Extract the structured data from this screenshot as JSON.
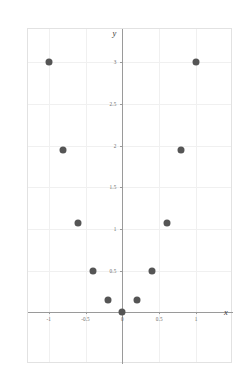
{
  "chart_data": {
    "type": "scatter",
    "title": "",
    "subtitle": "",
    "xlabel": "x",
    "ylabel": "y",
    "xlim": [
      -1.28,
      1.5
    ],
    "ylim": [
      -0.62,
      3.4
    ],
    "grid": true,
    "legend": null,
    "marker_color": "#555555",
    "x": [
      -1,
      -0.8,
      -0.6,
      -0.4,
      -0.2,
      0,
      0.2,
      0.4,
      0.6,
      0.8,
      1
    ],
    "y": [
      3,
      1.95,
      1.07,
      0.5,
      0.15,
      0,
      0.15,
      0.5,
      1.07,
      1.95,
      3
    ],
    "points": [
      {
        "x": -1,
        "y": 3
      },
      {
        "x": -0.8,
        "y": 1.95
      },
      {
        "x": -0.6,
        "y": 1.07
      },
      {
        "x": -0.4,
        "y": 0.5
      },
      {
        "x": -0.2,
        "y": 0.15
      },
      {
        "x": 0,
        "y": 0
      },
      {
        "x": 0.2,
        "y": 0.15
      },
      {
        "x": 0.4,
        "y": 0.5
      },
      {
        "x": 0.6,
        "y": 1.07
      },
      {
        "x": 0.8,
        "y": 1.95
      },
      {
        "x": 1,
        "y": 3
      }
    ],
    "x_ticks": [
      {
        "value": -1,
        "label": "-1"
      },
      {
        "value": -0.5,
        "label": "-0.5"
      },
      {
        "value": 0,
        "label": "0"
      },
      {
        "value": 0.5,
        "label": "0.5"
      },
      {
        "value": 1,
        "label": "1"
      }
    ],
    "y_ticks": [
      {
        "value": 0.5,
        "label": "0.5"
      },
      {
        "value": 1,
        "label": "1"
      },
      {
        "value": 1.5,
        "label": "1.5"
      },
      {
        "value": 2,
        "label": "2"
      },
      {
        "value": 2.5,
        "label": "2.5"
      },
      {
        "value": 3,
        "label": "3"
      }
    ],
    "x_gridlines": [
      -1,
      -0.5,
      0.5,
      1
    ],
    "y_gridlines": [
      0.5,
      1,
      1.5,
      2,
      2.5,
      3
    ],
    "colors": {
      "marker": "#555555",
      "axis": "#9a9a9a",
      "grid": "#f0f0f0",
      "frame": "#e2e2e2",
      "tick_text": "#6b6b6b",
      "axis_title": "#3a3a3a"
    }
  }
}
